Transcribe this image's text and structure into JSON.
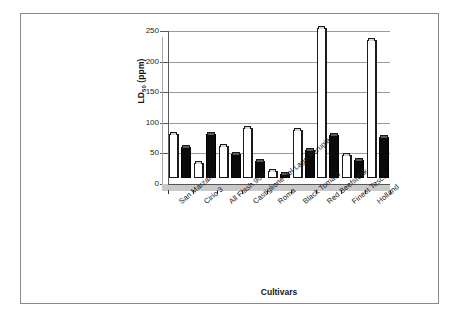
{
  "chart_data": {
    "type": "bar",
    "title": "",
    "xlabel": "Cultivars",
    "ylabel": "LD50 (ppm)",
    "ylabel_base": "LD",
    "ylabel_sub": "50",
    "ylabel_unit": " (ppm)",
    "ylim": [
      0,
      250
    ],
    "yticks": [
      0,
      50,
      100,
      150,
      200,
      250
    ],
    "grid": true,
    "legend": "none",
    "categories": [
      "San Marzano",
      "Cirio 3",
      "All Flash 900",
      "Castiglione del Lago Perugia",
      "Roma",
      "Black Tomato",
      "Red Beefsteak",
      "Finest Tesco",
      "Holland"
    ],
    "series": [
      {
        "name": "series-1",
        "style": "white",
        "values": [
          72,
          25,
          53,
          82,
          12,
          78,
          245,
          37,
          225
        ]
      },
      {
        "name": "series-2",
        "style": "black",
        "values": [
          51,
          72,
          39,
          28,
          7,
          45,
          71,
          30,
          67
        ]
      }
    ]
  },
  "axes": {
    "y_tick_labels": [
      "0",
      "50",
      "100",
      "150",
      "200",
      "250"
    ],
    "x_axis_title": "Cultivars",
    "y_axis_title": "LD50 (ppm)"
  }
}
